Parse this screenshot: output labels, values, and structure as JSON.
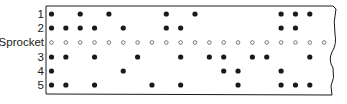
{
  "diagram": {
    "type": "paper-tape",
    "columns": 20,
    "rows": [
      {
        "label": "1",
        "kind": "data",
        "holes": [
          1,
          3,
          5,
          9,
          11,
          17,
          18,
          19
        ]
      },
      {
        "label": "2",
        "kind": "data",
        "holes": [
          1,
          2,
          3,
          4,
          6,
          9,
          10,
          17,
          18
        ]
      },
      {
        "label": "Sprocket",
        "kind": "sprocket",
        "holes": [
          1,
          2,
          3,
          4,
          5,
          6,
          7,
          8,
          9,
          10,
          11,
          12,
          13,
          14,
          15,
          16,
          17,
          18,
          19,
          20
        ]
      },
      {
        "label": "3",
        "kind": "data",
        "holes": [
          1,
          2,
          4,
          7,
          10,
          12,
          13,
          15,
          16,
          19
        ]
      },
      {
        "label": "4",
        "kind": "data",
        "holes": [
          1,
          6,
          13,
          14,
          17
        ]
      },
      {
        "label": "5",
        "kind": "data",
        "holes": [
          1,
          2,
          4,
          8,
          10,
          14,
          17,
          18,
          19
        ]
      }
    ],
    "colors": {
      "ink": "#1a1a1a",
      "tape": "#ffffff",
      "sprocket_outline": "#555555"
    }
  }
}
